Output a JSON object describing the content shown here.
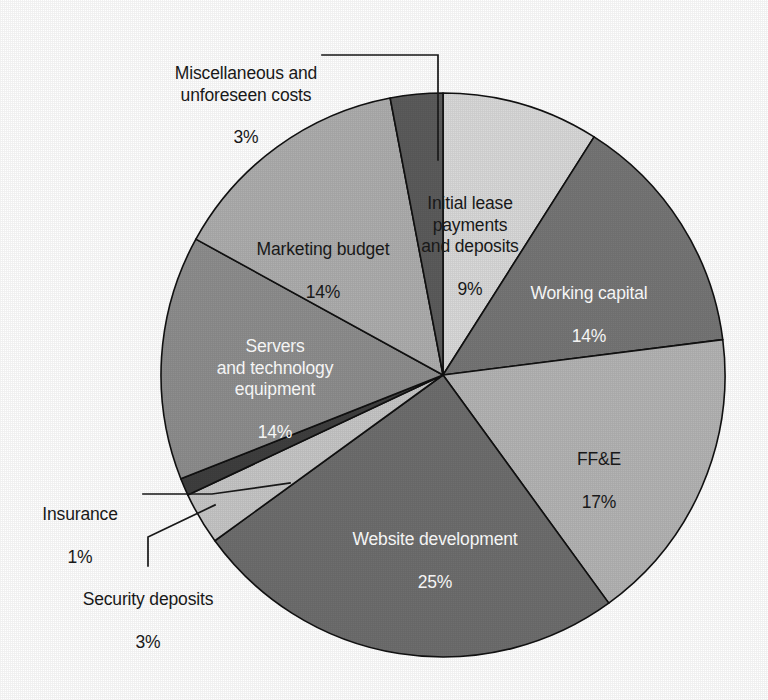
{
  "chart_data": {
    "type": "pie",
    "title": "",
    "subtitle": "",
    "xlabel": "",
    "ylabel": "",
    "legend_position": "none",
    "grid": false,
    "units": "percent",
    "total": 100,
    "start_angle_deg": 0,
    "direction": "clockwise",
    "categories": [
      "Initial lease payments and deposits",
      "Working capital",
      "FF&E",
      "Website development",
      "Security deposits",
      "Insurance",
      "Servers and technology equipment",
      "Marketing budget",
      "Miscellaneous and unforeseen costs"
    ],
    "values": [
      9,
      14,
      17,
      25,
      3,
      1,
      14,
      14,
      3
    ],
    "slices": [
      {
        "key": "initial-lease-payments-and-deposits",
        "label": "Initial lease\npayments\nand deposits",
        "percent_text": "9%",
        "value": 9,
        "color": "#d9d9d9",
        "label_placement": "inside",
        "text_color": "dark"
      },
      {
        "key": "working-capital",
        "label": "Working capital",
        "percent_text": "14%",
        "value": 14,
        "color": "#767676",
        "label_placement": "inside",
        "text_color": "light"
      },
      {
        "key": "ffe",
        "label": "FF&E",
        "percent_text": "17%",
        "value": 17,
        "color": "#b4b4b4",
        "label_placement": "inside",
        "text_color": "dark"
      },
      {
        "key": "website-development",
        "label": "Website development",
        "percent_text": "25%",
        "value": 25,
        "color": "#6e6e6e",
        "label_placement": "inside",
        "text_color": "light"
      },
      {
        "key": "security-deposits",
        "label": "Security deposits",
        "percent_text": "3%",
        "value": 3,
        "color": "#c6c6c6",
        "label_placement": "outside",
        "text_color": "dark"
      },
      {
        "key": "insurance",
        "label": "Insurance",
        "percent_text": "1%",
        "value": 1,
        "color": "#3f3f3f",
        "label_placement": "outside",
        "text_color": "dark"
      },
      {
        "key": "servers-and-technology-equipment",
        "label": "Servers\nand technology\nequipment",
        "percent_text": "14%",
        "value": 14,
        "color": "#8e8e8e",
        "label_placement": "inside",
        "text_color": "light"
      },
      {
        "key": "marketing-budget",
        "label": "Marketing budget",
        "percent_text": "14%",
        "value": 14,
        "color": "#aeaeae",
        "label_placement": "inside",
        "text_color": "dark"
      },
      {
        "key": "miscellaneous-and-unforeseen-costs",
        "label": "Miscellaneous and\nunforeseen costs",
        "percent_text": "3%",
        "value": 3,
        "color": "#5c5c5c",
        "label_placement": "outside",
        "text_color": "dark"
      }
    ]
  },
  "labels": {
    "initial_lease": {
      "name": "Initial lease\npayments\nand deposits",
      "pct": "9%"
    },
    "working_capital": {
      "name": "Working capital",
      "pct": "14%"
    },
    "ffe": {
      "name": "FF&E",
      "pct": "17%"
    },
    "website_development": {
      "name": "Website development",
      "pct": "25%"
    },
    "security_deposits": {
      "name": "Security deposits",
      "pct": "3%"
    },
    "insurance": {
      "name": "Insurance",
      "pct": "1%"
    },
    "servers": {
      "name": "Servers\nand technology\nequipment",
      "pct": "14%"
    },
    "marketing_budget": {
      "name": "Marketing budget",
      "pct": "14%"
    },
    "miscellaneous": {
      "name": "Miscellaneous and\nunforeseen costs",
      "pct": "3%"
    }
  },
  "geometry": {
    "center_x": 443,
    "center_y": 375,
    "radius": 282
  },
  "colors": {
    "background": "#ffffff",
    "outline": "#111111",
    "text_dark": "#1a1a1a",
    "text_light": "#ffffff"
  }
}
